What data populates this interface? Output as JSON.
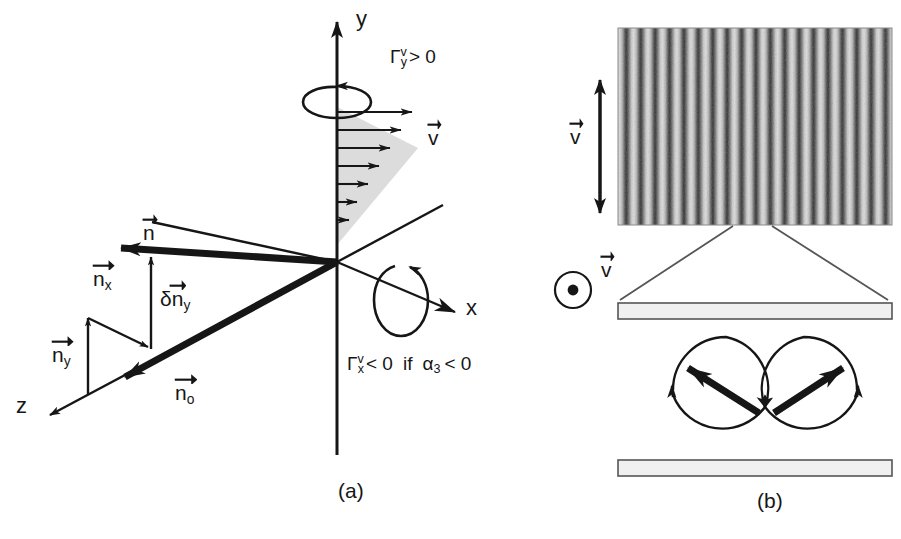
{
  "figure": {
    "type": "scientific-diagram",
    "background_color": "#ffffff",
    "ink_color": "#161616",
    "shade_color": "#d9d9d9"
  },
  "panel_a": {
    "caption": "(a)",
    "axes": [
      {
        "name": "y-axis",
        "label": "y"
      },
      {
        "name": "x-axis",
        "label": "x"
      },
      {
        "name": "z-axis",
        "label": "z"
      }
    ],
    "torque_labels": [
      {
        "name": "gamma-y",
        "symbol": "Γ",
        "sub": "y",
        "sup": "v",
        "relation": "> 0",
        "text": "Γyᵛ > 0"
      },
      {
        "name": "gamma-x",
        "symbol": "Γ",
        "sub": "x",
        "sup": "v",
        "relation": "< 0",
        "condition": "if α3 < 0",
        "text": "Γxᵛ < 0 if α3 < 0"
      }
    ],
    "gamma_y": {
      "symbol": "Γ",
      "sub": "y",
      "sup": "v",
      "rest": "> 0"
    },
    "gamma_x": {
      "symbol": "Γ",
      "sub": "x",
      "sup": "v",
      "rest": "< 0",
      "if_word": "if",
      "alpha": "α",
      "alpha_sub": "3",
      "alpha_rest": "< 0"
    },
    "vectors": [
      {
        "name": "velocity-vector",
        "label": "v",
        "overbar": true
      },
      {
        "name": "director-vector",
        "label": "n",
        "overbar": true
      },
      {
        "name": "director-x-component",
        "label": "n",
        "sub": "x",
        "overbar": true
      },
      {
        "name": "director-y-component",
        "label": "n",
        "sub": "y",
        "overbar": true
      },
      {
        "name": "director-perturbation-y",
        "label": "δn",
        "sub": "y",
        "overbar": true
      },
      {
        "name": "equilibrium-director",
        "label": "n",
        "sub": "o",
        "overbar": true
      }
    ],
    "v_label": "v",
    "n_label": "n",
    "nx_label": "n",
    "nx_sub": "x",
    "ny_label": "n",
    "ny_sub": "y",
    "dny_label": "δn",
    "dny_sub": "y",
    "no_label": "n",
    "no_sub": "o",
    "shear_profile": {
      "name": "shear-velocity-profile",
      "arrow_count": 8,
      "shaded": true
    },
    "rotation_loops": [
      {
        "name": "rotation-about-y",
        "axis": "y"
      },
      {
        "name": "rotation-about-x",
        "axis": "x"
      }
    ]
  },
  "panel_b": {
    "caption": "(b)",
    "stripe_image": {
      "name": "convection-stripe-photograph",
      "stripe_count": 19,
      "orientation": "vertical",
      "grayscale": true
    },
    "flow_arrow_vertical": {
      "name": "velocity-double-arrow",
      "label": "v",
      "overbar": true,
      "direction": "up-down"
    },
    "flow_arrow_out_of_plane": {
      "name": "velocity-out-of-plane",
      "label": "v",
      "overbar": true,
      "symbol": "circle-dot"
    },
    "v_label": "v",
    "plates": [
      {
        "name": "top-plate"
      },
      {
        "name": "bottom-plate"
      }
    ],
    "rolls": [
      {
        "name": "convection-roll-left",
        "circulation": "clockwise",
        "director_tilt": "up-left"
      },
      {
        "name": "convection-roll-right",
        "circulation": "counter-clockwise",
        "director_tilt": "up-right"
      }
    ]
  }
}
